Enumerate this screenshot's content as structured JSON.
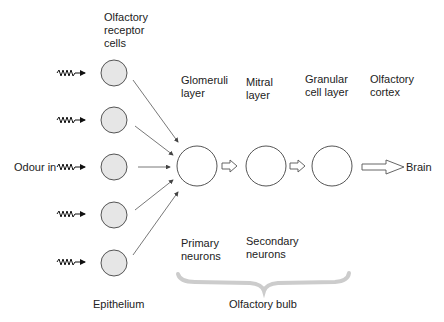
{
  "labels": {
    "receptor_cells": [
      "Olfactory",
      "receptor",
      "cells"
    ],
    "glomeruli": [
      "Glomeruli",
      "layer"
    ],
    "mitral": [
      "Mitral",
      "layer"
    ],
    "granular": [
      "Granular",
      "cell layer"
    ],
    "cortex": [
      "Olfactory",
      "cortex"
    ],
    "odour_in": "Odour in",
    "brain": "Brain",
    "primary": [
      "Primary",
      "neurons"
    ],
    "secondary": [
      "Secondary",
      "neurons"
    ],
    "epithelium": "Epithelium",
    "bulb": "Olfactory bulb"
  },
  "colors": {
    "receptor_fill": "#e6e6e6",
    "stroke": "#555555",
    "brace": "#cccccc"
  }
}
